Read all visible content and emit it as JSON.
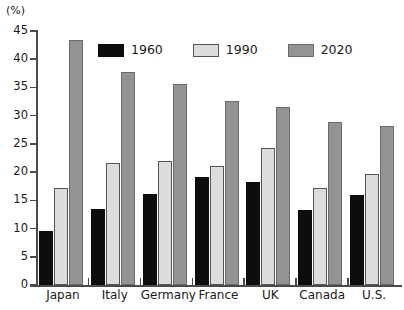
{
  "chart_data": {
    "type": "bar",
    "title": "",
    "xlabel": "",
    "ylabel": "(%)",
    "ylim": [
      0,
      45
    ],
    "yticks": [
      0,
      5,
      10,
      15,
      20,
      25,
      30,
      35,
      40,
      45
    ],
    "grid": false,
    "legend_position": "top-center",
    "categories": [
      "Japan",
      "Italy",
      "Germany",
      "France",
      "UK",
      "Canada",
      "U.S."
    ],
    "series": [
      {
        "name": "1960",
        "color": "#0d0d0d",
        "values": [
          9.5,
          13.4,
          16.1,
          19.1,
          18.3,
          13.3,
          15.9
        ]
      },
      {
        "name": "1990",
        "color": "#dcdcdc",
        "values": [
          17.2,
          21.7,
          21.9,
          21.1,
          24.3,
          17.2,
          19.7
        ]
      },
      {
        "name": "2020",
        "color": "#939393",
        "values": [
          43.4,
          37.7,
          35.7,
          32.6,
          31.6,
          28.9,
          28.1
        ]
      }
    ]
  },
  "axis": {
    "unit_label": "(%)"
  }
}
